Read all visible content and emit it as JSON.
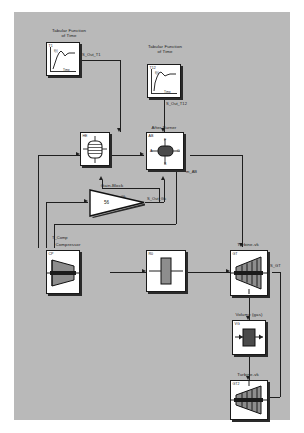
{
  "diagram": {
    "canvas_color": "#b9b9b9",
    "page_color": "#ffffff",
    "line_color": "#1f1f1f",
    "block_fill": "#ffffff"
  },
  "blocks": [
    {
      "id": "t1",
      "caption": "Tabular Function\nof Time",
      "tag": "T1",
      "y_axis_label": "f(t)",
      "x_axis_label": "Time"
    },
    {
      "id": "t12",
      "caption": "Tabular Function\nof Time",
      "tag": "T12",
      "y_axis_label": "f(t)",
      "x_axis_label": "Time"
    },
    {
      "id": "heat_exchanger",
      "caption": "",
      "tag": "HE"
    },
    {
      "id": "after_burner",
      "caption": "After Burner",
      "tag": "AB",
      "ports": [
        "A",
        "B",
        "C",
        "F"
      ]
    },
    {
      "id": "gain",
      "caption": "Gain-Block",
      "tag": "Gk",
      "value": "56"
    },
    {
      "id": "compressor",
      "caption": "Compressor",
      "tag": "CP"
    },
    {
      "id": "shaft",
      "caption": "",
      "tag": "R0"
    },
    {
      "id": "turbine_1",
      "caption": "Turbine-vk",
      "tag": "GT"
    },
    {
      "id": "volume_gas",
      "caption": "Volume (gas)",
      "tag": "VG"
    },
    {
      "id": "turbine_2",
      "caption": "Turbine-vk",
      "tag": "GT2"
    }
  ],
  "signals": [
    {
      "id": "s_out_t1",
      "label": "S_Out_T1"
    },
    {
      "id": "s_out_t12",
      "label": "S_Out_T12"
    },
    {
      "id": "s_out_gk",
      "label": "S_Out_Gk"
    },
    {
      "id": "m_ab",
      "label": "m_AB"
    },
    {
      "id": "s_gt",
      "label": "S_GT"
    },
    {
      "id": "t_comp",
      "label": "T_Comp"
    }
  ]
}
